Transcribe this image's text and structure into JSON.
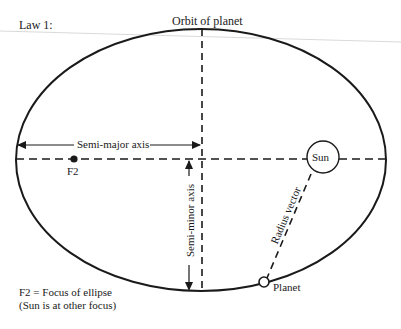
{
  "diagram": {
    "title": "Law 1:",
    "orbit_label": "Orbit of planet",
    "semi_major_label": "Semi-major axis",
    "semi_minor_label": "Semi-minor axis",
    "focus_label": "F2",
    "sun_label": "Sun",
    "radius_vector_label": "Radius vector",
    "planet_label": "Planet",
    "legend_line1": "F2  =  Focus of ellipse",
    "legend_line2": "(Sun is at other focus)"
  },
  "colors": {
    "ink": "#1a1a1a",
    "background": "#ffffff",
    "rule": "#bdbdbd"
  }
}
